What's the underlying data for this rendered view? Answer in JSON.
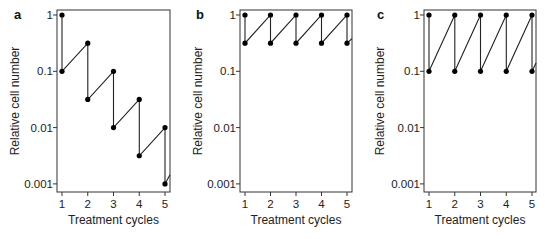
{
  "chart_data": [
    {
      "panel": "a",
      "type": "line",
      "xlabel": "Treatment cycles",
      "ylabel": "Relative cell number",
      "yscale": "log",
      "ylim": [
        0.001,
        1
      ],
      "xlim": [
        1,
        5
      ],
      "x_ticks": [
        "1",
        "2",
        "3",
        "4",
        "5"
      ],
      "y_ticks": [
        "1",
        "0.1",
        "0.01",
        "0.001"
      ],
      "points": [
        [
          1,
          1
        ],
        [
          1,
          0.1
        ],
        [
          2,
          0.316
        ],
        [
          2,
          0.0316
        ],
        [
          3,
          0.1
        ],
        [
          3,
          0.01
        ],
        [
          4,
          0.0316
        ],
        [
          4,
          0.00316
        ],
        [
          5,
          0.01
        ],
        [
          5,
          0.001
        ]
      ],
      "tail_to": [
        5.2,
        0.00145
      ]
    },
    {
      "panel": "b",
      "type": "line",
      "xlabel": "Treatment cycles",
      "ylabel": "Relative cell number",
      "yscale": "log",
      "ylim": [
        0.001,
        1
      ],
      "xlim": [
        1,
        5
      ],
      "x_ticks": [
        "1",
        "2",
        "3",
        "4",
        "5"
      ],
      "y_ticks": [
        "1",
        "0.1",
        "0.01",
        "0.001"
      ],
      "points": [
        [
          1,
          1
        ],
        [
          1,
          0.316
        ],
        [
          2,
          1
        ],
        [
          2,
          0.316
        ],
        [
          3,
          1
        ],
        [
          3,
          0.316
        ],
        [
          4,
          1
        ],
        [
          4,
          0.316
        ],
        [
          5,
          1
        ],
        [
          5,
          0.316
        ]
      ],
      "tail_to": [
        5.2,
        0.38
      ]
    },
    {
      "panel": "c",
      "type": "line",
      "xlabel": "Treatment cycles",
      "ylabel": "Relative cell number",
      "yscale": "log",
      "ylim": [
        0.001,
        1
      ],
      "xlim": [
        1,
        5
      ],
      "x_ticks": [
        "1",
        "2",
        "3",
        "4",
        "5"
      ],
      "y_ticks": [
        "1",
        "0.1",
        "0.01",
        "0.001"
      ],
      "points": [
        [
          1,
          1
        ],
        [
          1,
          0.1
        ],
        [
          2,
          1
        ],
        [
          2,
          0.1
        ],
        [
          3,
          1
        ],
        [
          3,
          0.1
        ],
        [
          4,
          1
        ],
        [
          4,
          0.1
        ],
        [
          5,
          1
        ],
        [
          5,
          0.1
        ]
      ],
      "tail_to": [
        5.2,
        0.14
      ]
    }
  ],
  "panels": [
    {
      "letter": "a",
      "xlabel": "Treatment cycles",
      "ylabel": "Relative cell number"
    },
    {
      "letter": "b",
      "xlabel": "Treatment cycles",
      "ylabel": "Relative cell number"
    },
    {
      "letter": "c",
      "xlabel": "Treatment cycles",
      "ylabel": "Relative cell number"
    }
  ]
}
